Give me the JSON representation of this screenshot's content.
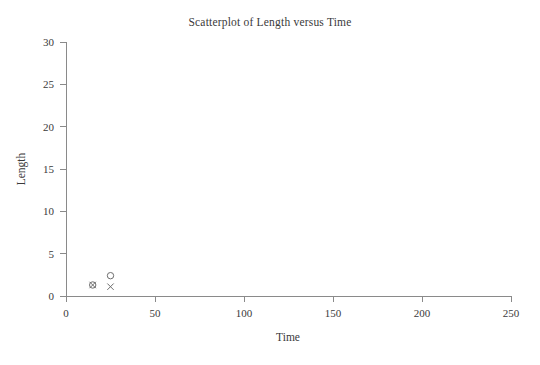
{
  "chart_data": {
    "type": "scatter",
    "title": "Scatterplot of Length versus Time",
    "xlabel": "Time",
    "ylabel": "Length",
    "xlim": [
      0,
      250
    ],
    "ylim": [
      0,
      30
    ],
    "xticks": [
      0,
      50,
      100,
      150,
      200,
      250
    ],
    "yticks": [
      0,
      5,
      10,
      15,
      20,
      25,
      30
    ],
    "xtick_labels": [
      "0",
      "50",
      "100",
      "150",
      "200",
      "250"
    ],
    "ytick_labels": [
      "0",
      "5",
      "10",
      "15",
      "20",
      "25",
      "30"
    ],
    "grid": false,
    "legend": "none",
    "series": [
      {
        "name": "circle-series",
        "marker": "circle",
        "color": "#6e6e6e",
        "points": [
          {
            "x": 15,
            "y": 1.3
          },
          {
            "x": 25,
            "y": 2.4
          }
        ]
      },
      {
        "name": "cross-series",
        "marker": "cross",
        "color": "#6e6e6e",
        "points": [
          {
            "x": 15,
            "y": 1.3
          },
          {
            "x": 25,
            "y": 1.1
          }
        ]
      }
    ]
  },
  "axes": {
    "x_tick_0": "0",
    "x_tick_1": "50",
    "x_tick_2": "100",
    "x_tick_3": "150",
    "x_tick_4": "200",
    "x_tick_5": "250",
    "y_tick_0": "0",
    "y_tick_1": "5",
    "y_tick_2": "10",
    "y_tick_3": "15",
    "y_tick_4": "20",
    "y_tick_5": "25",
    "y_tick_6": "30"
  }
}
